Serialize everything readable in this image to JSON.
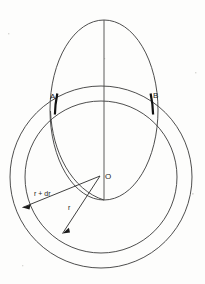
{
  "figure": {
    "background_color": "#fdfdfc",
    "stroke_color": "#3a3a3a",
    "bold_stroke_color": "#111111",
    "labels": {
      "point_a": "A",
      "point_b": "B",
      "center": "O",
      "outer_radius": "r + dr",
      "inner_radius": "r"
    },
    "geometry": {
      "ellipse": {
        "cx": 104,
        "cy": 110,
        "rx": 54,
        "ry": 90
      },
      "outer_circle": {
        "cx": 101,
        "cy": 177,
        "r": 91
      },
      "inner_circle": {
        "cx": 101,
        "cy": 177,
        "r": 76
      },
      "point_a": {
        "x": 57,
        "y": 95
      },
      "point_b": {
        "x": 150,
        "y": 95
      },
      "center_point": {
        "x": 101,
        "y": 175
      }
    }
  }
}
